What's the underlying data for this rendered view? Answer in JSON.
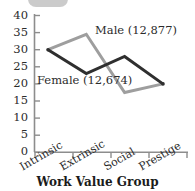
{
  "chart_data": {
    "type": "line",
    "title": "",
    "subtitle": "",
    "xlabel": "Work Value Group",
    "ylabel": "",
    "categories": [
      "Intrinsic",
      "Extrinsic",
      "Social",
      "Prestige"
    ],
    "ylim": [
      0,
      40
    ],
    "yticks": [
      0,
      5,
      10,
      15,
      20,
      25,
      30,
      35,
      40
    ],
    "ytick_labels": [
      "0",
      "5",
      "10",
      "15",
      "20",
      "25",
      "30",
      "35",
      "40"
    ],
    "grid": false,
    "legend_position": "inline-annotations",
    "series": [
      {
        "name": "Male",
        "label": "Male (12,877)",
        "count": "12,877",
        "color": "#9e9e9e",
        "values": [
          30,
          34.5,
          17.5,
          20
        ]
      },
      {
        "name": "Female",
        "label": "Female (12,674)",
        "count": "12,674",
        "color": "#2f2f2f",
        "values": [
          30,
          23,
          28,
          20
        ]
      }
    ],
    "annotations": [
      {
        "text": "Male (12,877)",
        "series": "Male"
      },
      {
        "text": "Female (12,674)",
        "series": "Female"
      }
    ],
    "axis_color": "#8d8d8d"
  },
  "axis": {
    "x_title": "Work Value Group",
    "y_ticks": [
      "40",
      "35",
      "30",
      "25",
      "20",
      "15",
      "10",
      "5",
      "0"
    ],
    "x_categories": [
      "Intrinsic",
      "Extrinsic",
      "Social",
      "Prestige"
    ]
  },
  "labels": {
    "male": "Male (12,877)",
    "female": "Female (12,674)"
  }
}
